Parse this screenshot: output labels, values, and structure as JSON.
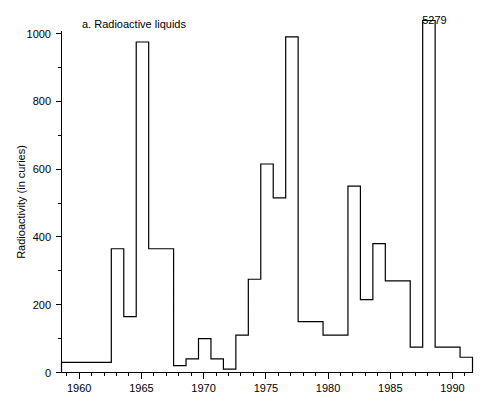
{
  "figure": {
    "panel_title": "a. Radioactive liquids",
    "peak_annotation": "5279",
    "background_color": "#ffffff",
    "line_color": "#000000"
  },
  "chart_data": {
    "type": "line",
    "subtype": "step",
    "title": "a. Radioactive liquids",
    "xlabel": "",
    "ylabel": "Radioactivity (in curies)",
    "xlim": [
      1958.5,
      1991.5
    ],
    "ylim": [
      0,
      1000
    ],
    "grid": false,
    "legend": null,
    "x_major_ticks": [
      1960,
      1965,
      1970,
      1975,
      1980,
      1985,
      1990
    ],
    "x_major_tick_labels": [
      "1960",
      "1965",
      "1970",
      "1975",
      "1980",
      "1985",
      "1990"
    ],
    "x_minor_ticks": [
      1959,
      1961,
      1962,
      1963,
      1964,
      1966,
      1967,
      1968,
      1969,
      1971,
      1972,
      1973,
      1974,
      1976,
      1977,
      1978,
      1979,
      1981,
      1982,
      1983,
      1984,
      1986,
      1987,
      1988,
      1989,
      1991
    ],
    "y_major_ticks": [
      0,
      200,
      400,
      600,
      800,
      1000
    ],
    "y_major_tick_labels": [
      "0",
      "200",
      "400",
      "600",
      "800",
      "1000"
    ],
    "y_minor_ticks": [
      100,
      300,
      500,
      700,
      900
    ],
    "annotations": [
      {
        "text": "5279",
        "x": 1988,
        "y": 1000,
        "note": "off-scale spike value"
      }
    ],
    "x": [
      1959,
      1960,
      1961,
      1962,
      1963,
      1964,
      1965,
      1966,
      1967,
      1968,
      1969,
      1970,
      1971,
      1972,
      1973,
      1974,
      1975,
      1976,
      1977,
      1978,
      1979,
      1980,
      1981,
      1982,
      1983,
      1984,
      1985,
      1986,
      1987,
      1988,
      1989,
      1990,
      1991
    ],
    "values": [
      30,
      30,
      30,
      30,
      365,
      165,
      975,
      365,
      365,
      20,
      40,
      100,
      40,
      10,
      110,
      275,
      615,
      515,
      990,
      150,
      150,
      110,
      110,
      550,
      215,
      380,
      270,
      270,
      75,
      5279,
      75,
      75,
      45
    ],
    "clipped_max_display": 1000,
    "note": "Step (histogram style) line; the 1988 value of 5279 extends beyond the plotted axis maximum of 1000 and is labelled directly."
  }
}
